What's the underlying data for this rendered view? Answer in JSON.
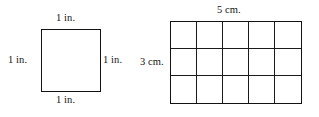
{
  "figure": {
    "line_color": "#121212",
    "background_color": "#ffffff",
    "text_color": "#141414"
  },
  "square": {
    "name": "unit square",
    "shape": "square",
    "labels": {
      "top": "1 in.",
      "left": "1 in.",
      "right": "1 in.",
      "bottom": "1 in."
    },
    "units": "in.",
    "side_length": 1
  },
  "grid": {
    "name": "rectangle grid",
    "shape": "rectangle",
    "columns": 5,
    "rows": 3,
    "cells": 15,
    "labels": {
      "top": "5 cm.",
      "left": "3 cm."
    },
    "units": "cm.",
    "width_value": 5,
    "height_value": 3
  },
  "chart_data": {
    "type": "table",
    "categories": [
      "square",
      "grid rectangle"
    ],
    "series": [
      {
        "name": "width",
        "values": [
          1,
          5
        ]
      },
      {
        "name": "height",
        "values": [
          1,
          3
        ]
      },
      {
        "name": "cells",
        "values": [
          1,
          15
        ]
      }
    ],
    "annotations": [
      "1 in.",
      "1 in.",
      "1 in.",
      "1 in.",
      "5 cm.",
      "3 cm."
    ],
    "xlabel": "",
    "ylabel": "",
    "grid": true,
    "legend": "none"
  }
}
